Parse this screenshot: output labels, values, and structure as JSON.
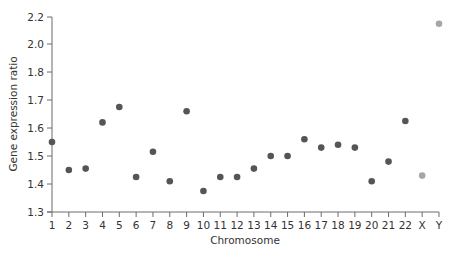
{
  "chart_data": {
    "type": "scatter",
    "title": "",
    "xlabel": "Chromosome",
    "ylabel": "Gene expression ratio",
    "categories": [
      "1",
      "2",
      "3",
      "4",
      "5",
      "6",
      "7",
      "8",
      "9",
      "10",
      "11",
      "12",
      "13",
      "14",
      "15",
      "16",
      "17",
      "18",
      "19",
      "20",
      "21",
      "22",
      "X",
      "Y"
    ],
    "values": [
      1.55,
      1.45,
      1.455,
      1.62,
      1.675,
      1.425,
      1.515,
      1.41,
      1.66,
      1.375,
      1.425,
      1.425,
      1.455,
      1.5,
      1.5,
      1.56,
      1.53,
      1.54,
      1.53,
      1.41,
      1.48,
      1.625,
      1.43,
      2.15
    ],
    "point_colors": [
      "#555555",
      "#555555",
      "#555555",
      "#555555",
      "#555555",
      "#555555",
      "#555555",
      "#555555",
      "#555555",
      "#555555",
      "#555555",
      "#555555",
      "#555555",
      "#555555",
      "#555555",
      "#555555",
      "#555555",
      "#555555",
      "#555555",
      "#555555",
      "#555555",
      "#555555",
      "#a6a6a6",
      "#a6a6a6"
    ],
    "y_ticks": [
      "1.3",
      "1.4",
      "1.5",
      "1.6",
      "1.7",
      "1.8",
      "2.0",
      "2.2"
    ],
    "y_tick_values": [
      1.3,
      1.4,
      1.5,
      1.6,
      1.7,
      1.8,
      2.0,
      2.2
    ],
    "ylim": [
      1.3,
      2.2
    ],
    "y_axis_note": "non-linear axis: ticks 1.3–1.8 step 0.1, then 2.0 and 2.2 at equal spacing",
    "grid": false,
    "legend": null,
    "colors": {
      "autosome": "#555555",
      "sex_chromosome": "#a6a6a6",
      "axis": "#6b6b6b",
      "text": "#333333"
    }
  }
}
